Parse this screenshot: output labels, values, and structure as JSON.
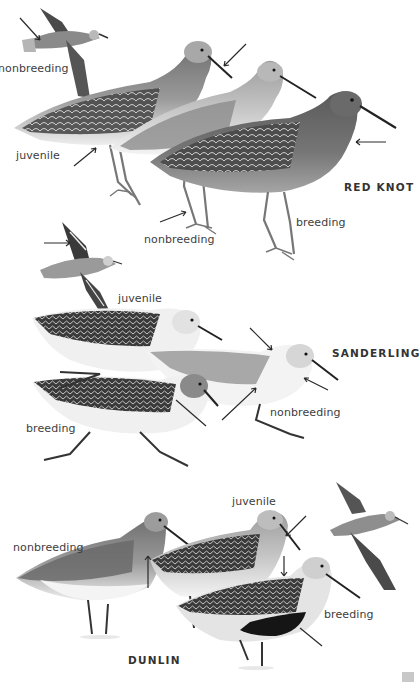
{
  "plate": {
    "species": [
      {
        "name": "RED KNOT",
        "labels": [
          "nonbreeding",
          "juvenile",
          "nonbreeding",
          "breeding"
        ]
      },
      {
        "name": "SANDERLING",
        "labels": [
          "juvenile",
          "nonbreeding",
          "breeding"
        ]
      },
      {
        "name": "DUNLIN",
        "labels": [
          "nonbreeding",
          "juvenile",
          "breeding"
        ]
      }
    ]
  },
  "colors": {
    "background": "#ffffff",
    "text": "#3a3a3a",
    "bird_dark": "#3c3c3c",
    "bird_mid": "#8a8a8a",
    "bird_light": "#d8d8d8",
    "belly": "#f2f2f2"
  }
}
